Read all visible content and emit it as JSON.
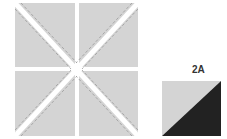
{
  "figure": {
    "main_block": {
      "description": "Four gray squares, each cut diagonally with dashed seam lines, arranged in a 2x2 grid with white X-shaped gaps",
      "fill_color": "#d4d4d4",
      "seam_color": "#9a9a9a"
    },
    "unit": {
      "label": "2A",
      "light_color": "#d4d4d4",
      "dark_color": "#222222"
    }
  }
}
